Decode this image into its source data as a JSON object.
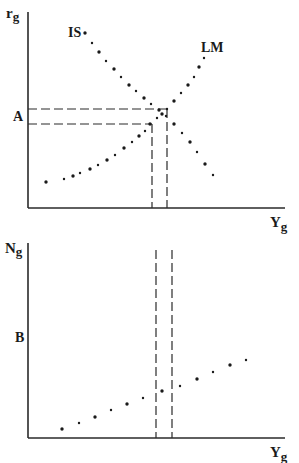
{
  "top_panel": {
    "y_axis_label": "r",
    "y_axis_sub": "g",
    "x_axis_label": "Y",
    "x_axis_sub": "g",
    "level_label": "A",
    "curves": [
      {
        "name": "IS",
        "label": "IS",
        "direction": "downward-sloping",
        "points": [
          [
            85,
            33
          ],
          [
            92,
            43
          ],
          [
            99,
            52
          ],
          [
            106,
            61
          ],
          [
            114,
            69
          ],
          [
            121,
            77
          ],
          [
            129,
            85
          ],
          [
            136,
            91
          ],
          [
            144,
            98
          ],
          [
            151,
            104
          ],
          [
            159,
            110
          ],
          [
            166,
            116
          ],
          [
            174,
            124
          ],
          [
            182,
            133
          ],
          [
            190,
            142
          ],
          [
            197,
            152
          ],
          [
            205,
            164
          ],
          [
            213,
            175
          ]
        ]
      },
      {
        "name": "LM",
        "label": "LM",
        "direction": "upward-sloping",
        "points": [
          [
            46,
            182
          ],
          [
            64,
            179
          ],
          [
            73,
            176
          ],
          [
            80,
            173
          ],
          [
            90,
            169
          ],
          [
            98,
            165
          ],
          [
            107,
            160
          ],
          [
            115,
            155
          ],
          [
            124,
            148
          ],
          [
            132,
            142
          ],
          [
            139,
            136
          ],
          [
            145,
            131
          ],
          [
            150,
            124
          ],
          [
            157,
            118
          ],
          [
            162,
            114
          ],
          [
            167,
            109
          ],
          [
            174,
            101
          ],
          [
            181,
            93
          ],
          [
            188,
            85
          ],
          [
            194,
            77
          ],
          [
            199,
            67
          ],
          [
            204,
            58
          ]
        ]
      }
    ],
    "dashed_guides": [
      {
        "y": 109,
        "x_end": 167
      },
      {
        "y": 124,
        "x_end": 152
      }
    ]
  },
  "bottom_panel": {
    "y_axis_label": "N",
    "y_axis_sub": "g",
    "x_axis_label": "Y",
    "x_axis_sub": "g",
    "level_label": "B",
    "vertical_dashed_x": [
      156,
      172
    ],
    "points": [
      [
        62,
        429
      ],
      [
        79,
        423
      ],
      [
        95,
        417
      ],
      [
        111,
        410
      ],
      [
        127,
        404
      ],
      [
        143,
        398
      ],
      [
        162,
        391
      ],
      [
        180,
        386
      ],
      [
        197,
        379
      ],
      [
        213,
        372
      ],
      [
        230,
        365
      ],
      [
        246,
        360
      ]
    ]
  }
}
